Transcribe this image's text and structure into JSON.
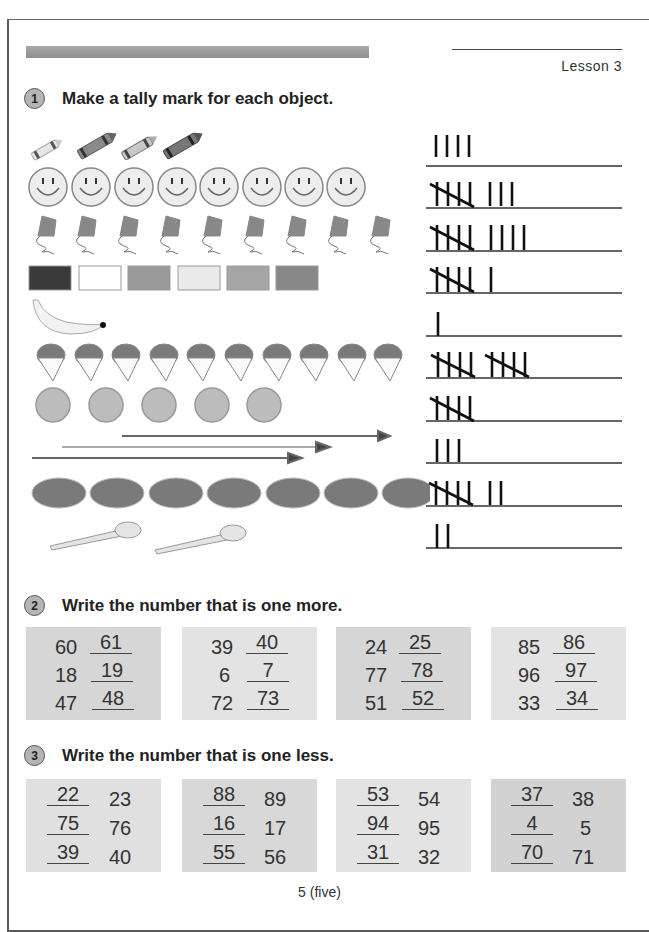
{
  "header": {
    "lesson_label": "Lesson 3"
  },
  "section1": {
    "number": "1",
    "title": "Make a tally mark for each object.",
    "rows": [
      {
        "object": "crayon",
        "count": 4,
        "tally": "||||"
      },
      {
        "object": "smiley-face",
        "count": 8,
        "tally": "卌 |||"
      },
      {
        "object": "kite",
        "count": 9,
        "tally": "卌 ||||"
      },
      {
        "object": "color-rectangle",
        "count": 6,
        "tally": "卌 |"
      },
      {
        "object": "banana",
        "count": 1,
        "tally": "|"
      },
      {
        "object": "spinning-top",
        "count": 10,
        "tally": "卌 卌"
      },
      {
        "object": "coin",
        "count": 5,
        "tally": "卌"
      },
      {
        "object": "arrow",
        "count": 3,
        "tally": "|||"
      },
      {
        "object": "football",
        "count": 7,
        "tally": "卌 ||"
      },
      {
        "object": "spoon",
        "count": 2,
        "tally": "||"
      }
    ]
  },
  "section2": {
    "number": "2",
    "title": "Write the number that is one more.",
    "boxes": [
      [
        {
          "given": "60",
          "answer": "61"
        },
        {
          "given": "18",
          "answer": "19"
        },
        {
          "given": "47",
          "answer": "48"
        }
      ],
      [
        {
          "given": "39",
          "answer": "40"
        },
        {
          "given": "6",
          "answer": "7"
        },
        {
          "given": "72",
          "answer": "73"
        }
      ],
      [
        {
          "given": "24",
          "answer": "25"
        },
        {
          "given": "77",
          "answer": "78"
        },
        {
          "given": "51",
          "answer": "52"
        }
      ],
      [
        {
          "given": "85",
          "answer": "86"
        },
        {
          "given": "96",
          "answer": "97"
        },
        {
          "given": "33",
          "answer": "34"
        }
      ]
    ]
  },
  "section3": {
    "number": "3",
    "title": "Write the number that is one less.",
    "boxes": [
      [
        {
          "answer": "22",
          "given": "23"
        },
        {
          "answer": "75",
          "given": "76"
        },
        {
          "answer": "39",
          "given": "40"
        }
      ],
      [
        {
          "answer": "88",
          "given": "89"
        },
        {
          "answer": "16",
          "given": "17"
        },
        {
          "answer": "55",
          "given": "56"
        }
      ],
      [
        {
          "answer": "53",
          "given": "54"
        },
        {
          "answer": "94",
          "given": "95"
        },
        {
          "answer": "31",
          "given": "32"
        }
      ],
      [
        {
          "answer": "37",
          "given": "38"
        },
        {
          "answer": "4",
          "given": "5"
        },
        {
          "answer": "70",
          "given": "71"
        }
      ]
    ]
  },
  "footer": {
    "page_label": "5 (five)"
  }
}
